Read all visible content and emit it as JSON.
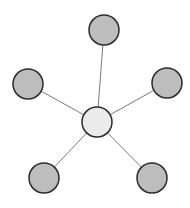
{
  "diagram": {
    "type": "star-graph",
    "width": 190,
    "height": 208,
    "colors": {
      "background": "#ffffff",
      "edge": "#7a7a7a",
      "node_stroke": "#2b2b2b",
      "hub_fill": "#ebebeb",
      "leaf_fill": "#bdbdbd"
    },
    "hub": {
      "id": "hub",
      "cx": 97,
      "cy": 122,
      "r": 15
    },
    "leaves": [
      {
        "id": "leaf-top",
        "cx": 104,
        "cy": 30,
        "r": 15
      },
      {
        "id": "leaf-left",
        "cx": 28,
        "cy": 84,
        "r": 15
      },
      {
        "id": "leaf-right",
        "cx": 167,
        "cy": 83,
        "r": 15
      },
      {
        "id": "leaf-bottom-left",
        "cx": 44,
        "cy": 178,
        "r": 15
      },
      {
        "id": "leaf-bottom-right",
        "cx": 152,
        "cy": 178,
        "r": 15
      }
    ],
    "edges": [
      {
        "from": "hub",
        "to": "leaf-top"
      },
      {
        "from": "hub",
        "to": "leaf-left"
      },
      {
        "from": "hub",
        "to": "leaf-right"
      },
      {
        "from": "hub",
        "to": "leaf-bottom-left"
      },
      {
        "from": "hub",
        "to": "leaf-bottom-right"
      }
    ]
  }
}
